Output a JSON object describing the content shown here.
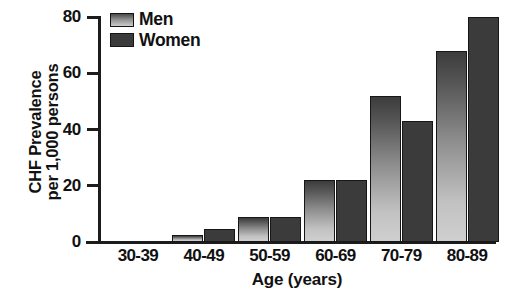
{
  "chart_data": {
    "type": "bar",
    "title": "",
    "xlabel": "Age (years)",
    "ylabel": "CHF Prevalence per 1,000 persons",
    "ylabel_lines": [
      "CHF Prevalence",
      "per 1,000 persons"
    ],
    "categories": [
      "30-39",
      "40-49",
      "50-59",
      "60-69",
      "70-79",
      "80-89"
    ],
    "series": [
      {
        "name": "Men",
        "values": [
          0,
          2.5,
          9,
          22,
          52,
          68
        ],
        "color": "#8f8f8f"
      },
      {
        "name": "Women",
        "values": [
          0,
          4.5,
          9,
          22,
          43,
          80
        ],
        "color": "#3b3b3b"
      }
    ],
    "ylim": [
      0,
      80
    ],
    "yticks": [
      0,
      20,
      40,
      60,
      80
    ],
    "ytick_labels": [
      "0",
      "20",
      "40",
      "60",
      "80"
    ],
    "grid": false,
    "legend_position": "top-left",
    "legend_entries": [
      "Men",
      "Women"
    ]
  },
  "legend": {
    "men_label": "Men",
    "women_label": "Women"
  },
  "axes": {
    "y_title_line1": "CHF Prevalence",
    "y_title_line2": "per 1,000 persons",
    "x_title": "Age (years)"
  }
}
